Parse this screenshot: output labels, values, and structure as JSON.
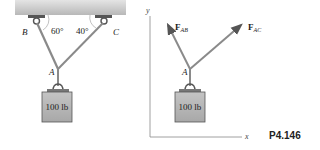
{
  "figure": {
    "problem_number": "P4.146",
    "left_panel": {
      "points": {
        "B": "B",
        "C": "C",
        "A": "A"
      },
      "angles": {
        "at_B": "60°",
        "at_C": "40°"
      },
      "weight_label": "100 lb"
    },
    "right_panel": {
      "point": "A",
      "forces": [
        {
          "bold": "F",
          "sub": "AB"
        },
        {
          "bold": "F",
          "sub": "AC"
        }
      ],
      "weight_label": "100 lb",
      "axes": {
        "x": "x",
        "y": "y"
      }
    },
    "colors": {
      "ceiling": "#c8c8c8",
      "weight_box": "#b4b4b4",
      "cable": "#8a8a8a",
      "text": "#222222"
    }
  }
}
